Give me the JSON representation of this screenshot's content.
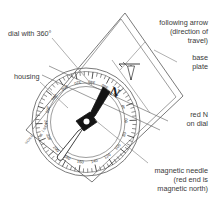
{
  "figure": {
    "background_color": "#ffffff",
    "ink_color": "#333333"
  },
  "labels": [
    {
      "id": "dial-with-360",
      "name": "dial-with-360-label",
      "lines": [
        "dial with 360°"
      ],
      "align": "start",
      "x": 8,
      "y": 36
    },
    {
      "id": "housing",
      "name": "housing-label",
      "lines": [
        "housing"
      ],
      "align": "start",
      "x": 14,
      "y": 79
    },
    {
      "id": "following-arrow",
      "name": "following-arrow-label",
      "lines": [
        "following arrow",
        "(direction of",
        "travel)"
      ],
      "align": "end",
      "x": 208,
      "y": 25
    },
    {
      "id": "base-plate",
      "name": "base-plate-label",
      "lines": [
        "base",
        "plate"
      ],
      "align": "end",
      "x": 208,
      "y": 60
    },
    {
      "id": "red-n-on-dial",
      "name": "red-n-on-dial-label",
      "lines": [
        "red N",
        "on dial"
      ],
      "align": "end",
      "x": 208,
      "y": 117
    },
    {
      "id": "magnetic-needle",
      "name": "magnetic-needle-label",
      "lines": [
        "magnetic needle",
        "(red end is",
        "magnetic north)"
      ],
      "align": "end",
      "x": 208,
      "y": 173
    }
  ],
  "dial": {
    "north_letter": "N",
    "degree_numbers": [
      "20",
      "40",
      "60",
      "80",
      "100",
      "120",
      "140",
      "160",
      "180",
      "200",
      "220",
      "240",
      "260",
      "280",
      "300",
      "320",
      "340",
      "360"
    ],
    "minor_tick_count": 72
  },
  "baseplate": {
    "edge_scale_text": "SCALE",
    "edge_marks": [
      "1:25",
      "1:50"
    ]
  },
  "needle": {
    "red_end_label": "red end",
    "white_end_label": "white end"
  }
}
